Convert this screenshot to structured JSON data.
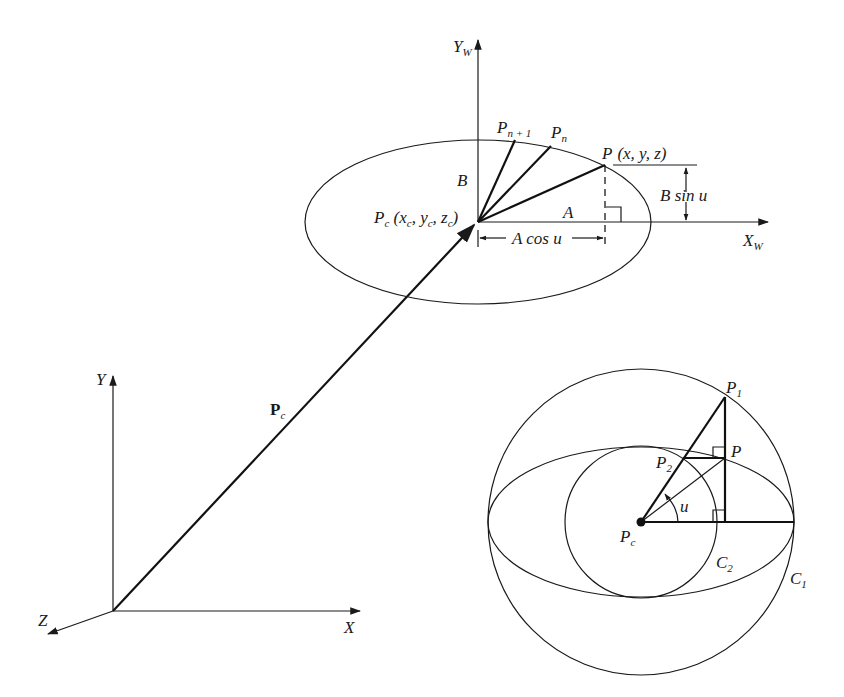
{
  "figure": {
    "world_axes": {
      "x": "X",
      "y": "Y",
      "z": "Z"
    },
    "center_vector_label": "P",
    "center_vector_sub": "c",
    "local_frame": {
      "x_label": "X",
      "x_sub": "W",
      "y_label": "Y",
      "y_sub": "W",
      "center_label": "P",
      "center_sub": "c",
      "center_coords": [
        "x",
        "c",
        "y",
        "c",
        "z",
        "c"
      ],
      "point_label": "P",
      "point_coords": "(x, y, z)",
      "pn_label": "P",
      "pn_sub": "n",
      "pn1_label": "P",
      "pn1_sub": "n + 1",
      "semi_major": "A",
      "semi_minor": "B",
      "a_cos": "A cos u",
      "b_sin": "B sin u"
    },
    "construction": {
      "center_label": "P",
      "center_sub": "c",
      "p1_label": "P",
      "p1_sub": "1",
      "p2_label": "P",
      "p2_sub": "2",
      "p_label": "P",
      "angle_label": "u",
      "c1_label": "C",
      "c1_sub": "1",
      "c2_label": "C",
      "c2_sub": "2"
    }
  }
}
